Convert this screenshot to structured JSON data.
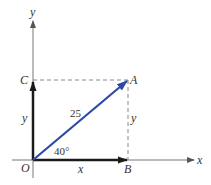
{
  "diagram": {
    "title": "",
    "axes": {
      "x_label": "x",
      "y_label": "y"
    },
    "points": {
      "origin": "O",
      "A": "A",
      "B": "B",
      "C": "C"
    },
    "vector": {
      "magnitude_label": "25",
      "angle_label": "40°"
    },
    "components": {
      "x_label": "x",
      "y_label_left": "y",
      "y_label_right": "y"
    },
    "colors": {
      "vector": "#2b4aa8",
      "components": "#1a1a1a",
      "axes": "#777777",
      "dashed": "#888888"
    }
  }
}
